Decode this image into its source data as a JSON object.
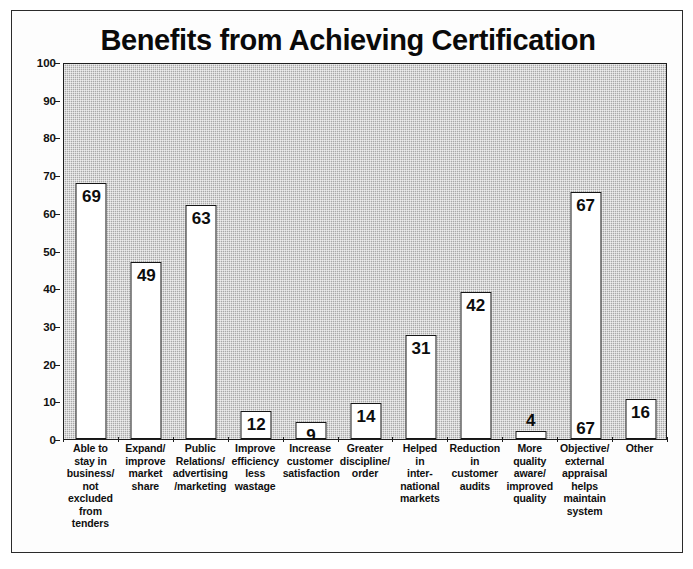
{
  "chart_data": {
    "type": "bar",
    "title": "Benefits from Achieving Certification",
    "xlabel": "",
    "ylabel": "",
    "ylim": [
      0,
      100
    ],
    "ytick_step": 10,
    "yticks": [
      0,
      10,
      20,
      30,
      40,
      50,
      60,
      70,
      80,
      90,
      100
    ],
    "grid": false,
    "legend": null,
    "plot_background": "#a8a8a8",
    "bar_fill": "#ffffff",
    "bar_border": "#151515",
    "categories": [
      "Able to\nstay in\nbusiness/\nnot\nexcluded\nfrom\ntenders",
      "Expand/\nimprove\nmarket\nshare",
      "Public\nRelations/\nadvertising\n/marketing",
      "Improve\nefficiency\nless\nwastage",
      "Increase\ncustomer\nsatisfaction",
      "Greater\ndiscipline/\norder",
      "Helped\nin\ninter-\nnational\nmarkets",
      "Reduction\nin\ncustomer\naudits",
      "More\nquality\naware/\nimproved\nquality",
      "Objective/\nexternal\nappraisal\nhelps\nmaintain\nsystem",
      "Other"
    ],
    "values": [
      69,
      49,
      63,
      12,
      9,
      14,
      31,
      42,
      4,
      67,
      16
    ],
    "bar_pixel_heights": [
      68,
      47,
      62,
      7.5,
      4.5,
      9.5,
      27.5,
      39,
      2,
      65.5,
      10.5
    ],
    "label_positions": [
      "inside",
      "inside",
      "inside",
      "inside",
      "inside",
      "inside",
      "inside",
      "inside",
      "above",
      "inside",
      "inside"
    ],
    "duplicate_bottom_labels": {
      "9": "67"
    }
  }
}
